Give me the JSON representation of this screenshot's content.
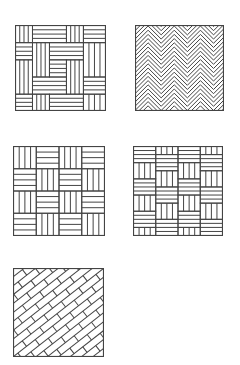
{
  "colors": {
    "line": "#444444",
    "background": "#ffffff"
  },
  "patterns": [
    {
      "id": "basketweave-pinwheel",
      "label": "Pinwheel basket weave",
      "x": 15,
      "y": 25,
      "w": 91,
      "h": 86
    },
    {
      "id": "herringbone",
      "label": "Herringbone",
      "x": 135,
      "y": 25,
      "w": 89,
      "h": 86
    },
    {
      "id": "basketweave",
      "label": "Basket weave",
      "x": 13,
      "y": 146,
      "w": 92,
      "h": 90
    },
    {
      "id": "staggered-basketweave",
      "label": "Staggered basket weave",
      "x": 133,
      "y": 146,
      "w": 90,
      "h": 90
    },
    {
      "id": "diagonal-brick",
      "label": "Diagonal brick",
      "x": 13,
      "y": 268,
      "w": 91,
      "h": 89
    }
  ]
}
